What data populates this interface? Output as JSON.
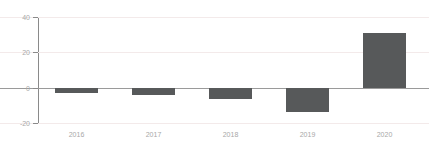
{
  "chart_data": {
    "type": "bar",
    "title": "",
    "subtitle": "",
    "xlabel": "",
    "ylabel": "",
    "categories": [
      "2016",
      "2017",
      "2018",
      "2019",
      "2020"
    ],
    "values": [
      -3,
      -4,
      -6.5,
      -13.5,
      31
    ],
    "series": [
      {
        "name": "",
        "values": [
          -3,
          -4,
          -6.5,
          -13.5,
          31
        ]
      }
    ],
    "ylim": [
      -20,
      40
    ],
    "yticks": [
      40,
      20,
      0,
      -20
    ],
    "ytick_labels": [
      "40",
      "20",
      "0",
      "-20"
    ],
    "grid": true,
    "grid_axis": "y",
    "legend": false,
    "legend_position": "none",
    "annotations": [],
    "colors": {
      "bar_fill": "#57595a",
      "gridline": "#f3eaea",
      "axis_line": "#8a8a8a",
      "zero_line": "#9a9a9a",
      "tick_text": "#a8a8a8",
      "background": "#ffffff"
    }
  }
}
